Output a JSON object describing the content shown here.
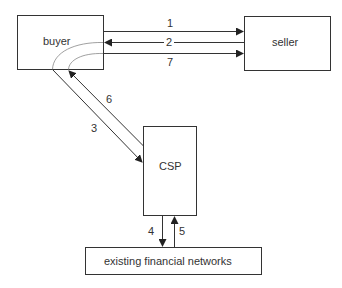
{
  "diagram": {
    "nodes": {
      "buyer": {
        "label": "buyer"
      },
      "seller": {
        "label": "seller"
      },
      "csp": {
        "label": "CSP"
      },
      "financial": {
        "label": "existing financial networks"
      }
    },
    "edges": [
      {
        "id": "1",
        "label": "1",
        "from": "buyer",
        "to": "seller"
      },
      {
        "id": "2",
        "label": "2",
        "from": "seller",
        "to": "buyer"
      },
      {
        "id": "3",
        "label": "3",
        "from": "buyer",
        "to": "csp"
      },
      {
        "id": "4",
        "label": "4",
        "from": "csp",
        "to": "financial"
      },
      {
        "id": "5",
        "label": "5",
        "from": "financial",
        "to": "csp"
      },
      {
        "id": "6",
        "label": "6",
        "from": "csp",
        "to": "buyer"
      },
      {
        "id": "7",
        "label": "7",
        "from": "buyer",
        "to": "seller"
      }
    ],
    "colors": {
      "stroke": "#333333",
      "curve": "#888888",
      "background": "#ffffff"
    }
  }
}
